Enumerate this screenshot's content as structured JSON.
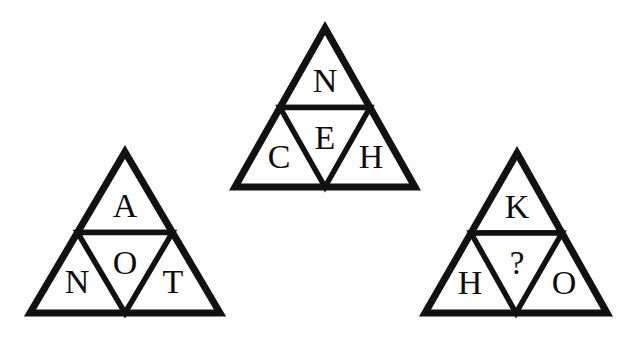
{
  "image": {
    "title": "Triangle letter puzzle",
    "background_color": "#fdfdfd",
    "ink_color": "#111111",
    "width": 644,
    "height": 340
  },
  "puzzle": {
    "shape": "triangle",
    "cells_per_triangle": 4,
    "cell_order": [
      "top",
      "bottom_left",
      "center",
      "bottom_right"
    ],
    "unknown_marker": "?"
  },
  "triangles": [
    {
      "id": "triangle-left",
      "name": "left-triangle",
      "apex": {
        "x": 125,
        "y": 152
      },
      "left": {
        "x": 30,
        "y": 313
      },
      "right": {
        "x": 220,
        "y": 313
      },
      "cells": {
        "top": {
          "label": "A",
          "x": 125,
          "y": 209
        },
        "bottom_left": {
          "label": "N",
          "x": 77,
          "y": 285
        },
        "center": {
          "label": "O",
          "x": 125,
          "y": 266
        },
        "bottom_right": {
          "label": "T",
          "x": 173,
          "y": 285
        }
      }
    },
    {
      "id": "triangle-middle",
      "name": "middle-triangle",
      "apex": {
        "x": 325,
        "y": 28
      },
      "left": {
        "x": 235,
        "y": 187
      },
      "right": {
        "x": 415,
        "y": 187
      },
      "cells": {
        "top": {
          "label": "N",
          "x": 325,
          "y": 84
        },
        "bottom_left": {
          "label": "C",
          "x": 279,
          "y": 160
        },
        "center": {
          "label": "E",
          "x": 325,
          "y": 141
        },
        "bottom_right": {
          "label": "H",
          "x": 371,
          "y": 160
        }
      }
    },
    {
      "id": "triangle-right",
      "name": "right-triangle",
      "apex": {
        "x": 517,
        "y": 153
      },
      "left": {
        "x": 425,
        "y": 313
      },
      "right": {
        "x": 607,
        "y": 313
      },
      "cells": {
        "top": {
          "label": "K",
          "x": 517,
          "y": 210
        },
        "bottom_left": {
          "label": "H",
          "x": 470,
          "y": 286
        },
        "center": {
          "label": "?",
          "x": 517,
          "y": 266
        },
        "bottom_right": {
          "label": "O",
          "x": 564,
          "y": 286
        }
      }
    }
  ]
}
